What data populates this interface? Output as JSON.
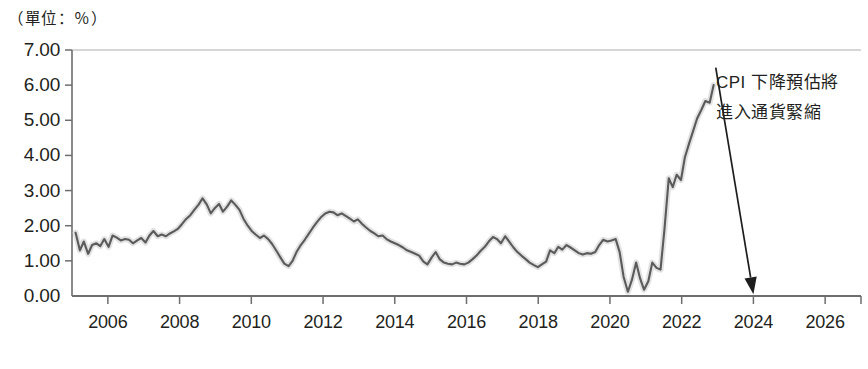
{
  "chart_data": {
    "type": "line",
    "title": "",
    "unit_label": "（單位：％）",
    "xlabel": "",
    "ylabel": "",
    "xlim": [
      2005.0,
      2027.0
    ],
    "ylim": [
      0.0,
      7.0
    ],
    "grid": false,
    "legend": "none",
    "y_ticks": [
      "0.00",
      "1.00",
      "2.00",
      "3.00",
      "4.00",
      "5.00",
      "6.00",
      "7.00"
    ],
    "y_tick_values": [
      0,
      1,
      2,
      3,
      4,
      5,
      6,
      7
    ],
    "x_ticks": [
      "2006",
      "2008",
      "2010",
      "2012",
      "2014",
      "2016",
      "2018",
      "2020",
      "2022",
      "2024",
      "2026"
    ],
    "x_tick_values": [
      2006,
      2008,
      2010,
      2012,
      2014,
      2016,
      2018,
      2020,
      2022,
      2024,
      2026
    ],
    "series": [
      {
        "name": "CPI",
        "color": "#5a5a5a",
        "x": [
          2005.1,
          2005.22,
          2005.33,
          2005.45,
          2005.56,
          2005.68,
          2005.79,
          2005.9,
          2006.02,
          2006.13,
          2006.25,
          2006.36,
          2006.48,
          2006.59,
          2006.7,
          2006.82,
          2006.93,
          2007.05,
          2007.16,
          2007.27,
          2007.39,
          2007.5,
          2007.62,
          2007.73,
          2007.84,
          2007.96,
          2008.07,
          2008.19,
          2008.3,
          2008.41,
          2008.53,
          2008.64,
          2008.76,
          2008.87,
          2008.98,
          2009.1,
          2009.21,
          2009.33,
          2009.44,
          2009.55,
          2009.67,
          2009.78,
          2009.9,
          2010.01,
          2010.12,
          2010.24,
          2010.35,
          2010.47,
          2010.58,
          2010.69,
          2010.81,
          2010.92,
          2011.04,
          2011.15,
          2011.26,
          2011.38,
          2011.49,
          2011.61,
          2011.72,
          2011.83,
          2011.95,
          2012.06,
          2012.18,
          2012.29,
          2012.4,
          2012.52,
          2012.63,
          2012.75,
          2012.86,
          2012.97,
          2013.09,
          2013.2,
          2013.32,
          2013.43,
          2013.54,
          2013.66,
          2013.77,
          2013.89,
          2014.0,
          2014.11,
          2014.23,
          2014.34,
          2014.46,
          2014.57,
          2014.68,
          2014.8,
          2014.91,
          2015.03,
          2015.14,
          2015.25,
          2015.37,
          2015.48,
          2015.6,
          2015.71,
          2015.82,
          2015.94,
          2016.05,
          2016.17,
          2016.28,
          2016.39,
          2016.51,
          2016.62,
          2016.74,
          2016.85,
          2016.96,
          2017.08,
          2017.19,
          2017.31,
          2017.42,
          2017.53,
          2017.65,
          2017.76,
          2017.88,
          2017.99,
          2018.1,
          2018.22,
          2018.33,
          2018.45,
          2018.56,
          2018.67,
          2018.79,
          2018.9,
          2019.02,
          2019.13,
          2019.24,
          2019.36,
          2019.47,
          2019.59,
          2019.7,
          2019.81,
          2019.93,
          2020.04,
          2020.16,
          2020.27,
          2020.38,
          2020.5,
          2020.61,
          2020.73,
          2020.84,
          2020.95,
          2021.07,
          2021.18,
          2021.3,
          2021.41,
          2021.52,
          2021.64,
          2021.75,
          2021.86,
          2021.98,
          2022.09,
          2022.21,
          2022.32,
          2022.43,
          2022.55,
          2022.66,
          2022.78,
          2022.89
        ],
        "y": [
          1.8,
          1.3,
          1.55,
          1.2,
          1.45,
          1.5,
          1.42,
          1.62,
          1.4,
          1.72,
          1.66,
          1.58,
          1.62,
          1.6,
          1.5,
          1.58,
          1.65,
          1.52,
          1.72,
          1.85,
          1.7,
          1.75,
          1.7,
          1.78,
          1.84,
          1.92,
          2.05,
          2.2,
          2.3,
          2.45,
          2.6,
          2.78,
          2.6,
          2.35,
          2.5,
          2.62,
          2.4,
          2.55,
          2.72,
          2.6,
          2.45,
          2.2,
          2.0,
          1.85,
          1.75,
          1.65,
          1.72,
          1.62,
          1.48,
          1.3,
          1.1,
          0.92,
          0.85,
          1.0,
          1.25,
          1.45,
          1.6,
          1.78,
          1.95,
          2.1,
          2.25,
          2.35,
          2.4,
          2.38,
          2.3,
          2.35,
          2.28,
          2.2,
          2.12,
          2.18,
          2.05,
          1.95,
          1.85,
          1.78,
          1.7,
          1.72,
          1.62,
          1.55,
          1.5,
          1.45,
          1.38,
          1.3,
          1.25,
          1.2,
          1.15,
          0.98,
          0.9,
          1.1,
          1.25,
          1.05,
          0.95,
          0.92,
          0.9,
          0.95,
          0.92,
          0.9,
          0.95,
          1.05,
          1.15,
          1.28,
          1.4,
          1.55,
          1.68,
          1.62,
          1.5,
          1.7,
          1.55,
          1.38,
          1.25,
          1.15,
          1.05,
          0.95,
          0.88,
          0.82,
          0.9,
          0.98,
          1.3,
          1.22,
          1.4,
          1.32,
          1.45,
          1.38,
          1.3,
          1.22,
          1.18,
          1.22,
          1.2,
          1.25,
          1.45,
          1.6,
          1.55,
          1.58,
          1.62,
          1.25,
          0.55,
          0.12,
          0.45,
          0.95,
          0.5,
          0.18,
          0.42,
          0.95,
          0.8,
          0.75,
          1.9,
          3.35,
          3.1,
          3.45,
          3.3,
          3.95,
          4.35,
          4.7,
          5.05,
          5.3,
          5.55,
          5.5,
          6.0
        ]
      }
    ],
    "annotation": {
      "line1": "CPI 下降預估將",
      "line2": "進入通貨緊縮",
      "arrow_from": {
        "x": 2022.95,
        "y": 6.5
      },
      "arrow_to": {
        "x": 2024.0,
        "y": 0.05
      }
    }
  },
  "colors": {
    "line": "#5a5a5a",
    "halo": "#d8d8d8",
    "axis": "#6e6e6e",
    "text": "#231f20",
    "background": "#ffffff"
  }
}
